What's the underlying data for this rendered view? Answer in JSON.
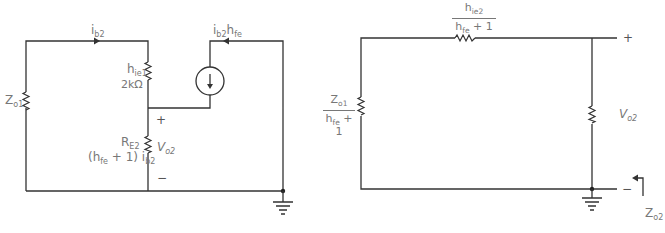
{
  "colors": {
    "wire": "#333333",
    "label": "#777777",
    "background": "#ffffff"
  },
  "left_circuit": {
    "current_top": {
      "main": "i",
      "sub": "b2"
    },
    "source_label": {
      "main1": "i",
      "sub1": "b2",
      "main2": "h",
      "sub2": "fe"
    },
    "z_o1": {
      "main": "Z",
      "sub": "o1"
    },
    "h_ie1": {
      "main": "h",
      "sub": "ie1"
    },
    "h_ie1_value": "2kΩ",
    "r_e2": {
      "main": "R",
      "sub": "E2"
    },
    "r_e2_current": {
      "prefix": "(h",
      "sub_fe": "fe",
      "middle": " + 1) i",
      "sub_b2": "b2"
    },
    "v_o2": {
      "main": "V",
      "sub": "o2"
    },
    "plus": "+",
    "minus": "−",
    "source_icon": "dependent-current-source-down-arrow",
    "ground_icon": "ground-symbol"
  },
  "right_circuit": {
    "top_resistor": {
      "num_main": "h",
      "num_sub": "ie2",
      "den_main": "h",
      "den_sub": "fe",
      "den_tail": " + 1"
    },
    "left_resistor": {
      "num_main": "Z",
      "num_sub": "o1",
      "den_main": "h",
      "den_sub": "fe",
      "den_tail": " + 1"
    },
    "v_o2": {
      "main": "V",
      "sub": "o2"
    },
    "plus": "+",
    "minus": "−",
    "z_o2": {
      "main": "Z",
      "sub": "o2"
    },
    "ground_icon": "ground-symbol"
  }
}
